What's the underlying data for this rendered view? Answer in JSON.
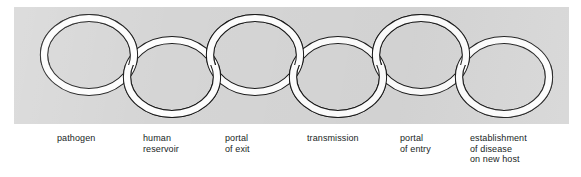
{
  "figure": {
    "panel_color": "#d5d5d5",
    "page_background": "#ffffff",
    "link_fill": "#ffffff",
    "link_outline": "#1a1a1a",
    "text_color": "#201e1e"
  },
  "links": [
    {
      "id": "link-1",
      "label": "pathogen",
      "cx": 75,
      "cy": 48,
      "rx": 45,
      "ry": 37,
      "row": "upper"
    },
    {
      "id": "link-2",
      "label": "human\nreservoir",
      "cx": 158,
      "cy": 70,
      "rx": 45,
      "ry": 37,
      "row": "lower"
    },
    {
      "id": "link-3",
      "label": "portal\nof exit",
      "cx": 241,
      "cy": 48,
      "rx": 45,
      "ry": 37,
      "row": "upper"
    },
    {
      "id": "link-4",
      "label": "transmission",
      "cx": 324,
      "cy": 70,
      "rx": 45,
      "ry": 37,
      "row": "lower"
    },
    {
      "id": "link-5",
      "label": "portal\nof entry",
      "cx": 407,
      "cy": 48,
      "rx": 45,
      "ry": 37,
      "row": "upper"
    },
    {
      "id": "link-6",
      "label": "establishment\nof disease\non new host",
      "cx": 490,
      "cy": 70,
      "rx": 45,
      "ry": 37,
      "row": "lower"
    }
  ]
}
